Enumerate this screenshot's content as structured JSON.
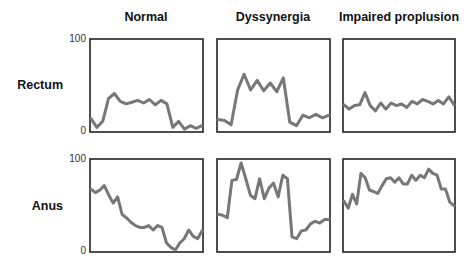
{
  "figure": {
    "columns": [
      "Normal",
      "Dyssynergia",
      "Impaired proplusion"
    ],
    "rows": [
      "Rectum",
      "Anus"
    ],
    "y_ticks": {
      "top": "100",
      "bottom": "0"
    }
  },
  "colors": {
    "trace": "#777777",
    "frame": "#222222"
  },
  "chart_data": {
    "type": "line",
    "title": "",
    "layout": "2x3 small multiples",
    "column_labels": [
      "Normal",
      "Dyssynergia",
      "Impaired proplusion"
    ],
    "row_labels": [
      "Rectum",
      "Anus"
    ],
    "ylim": [
      0,
      100
    ],
    "y_tick_labels": [
      "0",
      "100"
    ],
    "x_axis": "time (unlabeled)",
    "grid": false,
    "legend": null,
    "panels": [
      {
        "row": "Rectum",
        "column": "Normal",
        "values": [
          13,
          3,
          10,
          36,
          42,
          33,
          30,
          32,
          34,
          31,
          35,
          29,
          34,
          30,
          3,
          10,
          1,
          5,
          2,
          5
        ]
      },
      {
        "row": "Rectum",
        "column": "Dyssynergia",
        "values": [
          12,
          11,
          6,
          46,
          64,
          46,
          57,
          45,
          54,
          44,
          60,
          9,
          5,
          17,
          14,
          18,
          14,
          17
        ]
      },
      {
        "row": "Rectum",
        "column": "Impaired proplusion",
        "values": [
          29,
          24,
          28,
          29,
          43,
          28,
          22,
          31,
          24,
          31,
          28,
          30,
          26,
          33,
          30,
          35,
          33,
          30,
          34,
          30,
          38,
          29
        ]
      },
      {
        "row": "Anus",
        "column": "Normal",
        "values": [
          70,
          66,
          69,
          74,
          63,
          54,
          61,
          41,
          37,
          32,
          28,
          26,
          26,
          28,
          23,
          28,
          26,
          8,
          3,
          0,
          8,
          13,
          23,
          16,
          13,
          22
        ]
      },
      {
        "row": "Anus",
        "column": "Dyssynergia",
        "values": [
          41,
          40,
          37,
          80,
          81,
          100,
          82,
          63,
          59,
          82,
          59,
          71,
          77,
          61,
          86,
          82,
          15,
          13,
          22,
          23,
          30,
          33,
          31,
          35,
          35
        ]
      },
      {
        "row": "Anus",
        "column": "Impaired proplusion",
        "values": [
          56,
          48,
          64,
          53,
          88,
          83,
          69,
          67,
          65,
          74,
          82,
          83,
          78,
          83,
          76,
          76,
          86,
          80,
          86,
          83,
          93,
          88,
          86,
          70,
          70,
          55,
          51
        ]
      }
    ]
  }
}
